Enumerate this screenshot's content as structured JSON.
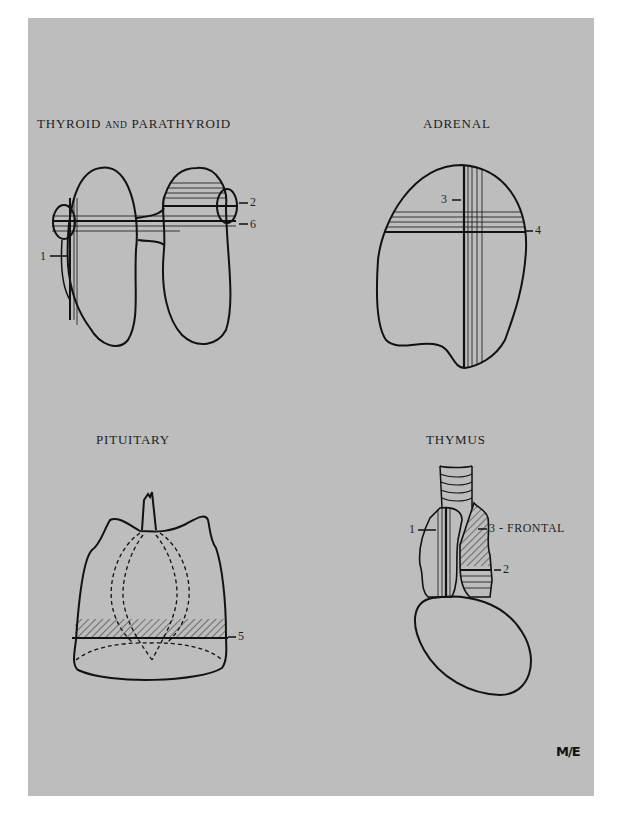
{
  "plate": {
    "background_color": "#bdbdbd",
    "page_color": "#ffffff",
    "ink_color": "#111111"
  },
  "panels": {
    "thyroid": {
      "title_main_1": "THYROID",
      "title_small": "AND",
      "title_main_2": "PARATHYROID",
      "markers": [
        {
          "id": "1",
          "label": "1"
        },
        {
          "id": "2",
          "label": "2"
        },
        {
          "id": "6",
          "label": "6"
        }
      ]
    },
    "adrenal": {
      "title": "ADRENAL",
      "markers": [
        {
          "id": "3",
          "label": "3"
        },
        {
          "id": "4",
          "label": "4"
        }
      ]
    },
    "pituitary": {
      "title": "PITUITARY",
      "markers": [
        {
          "id": "5",
          "label": "5"
        }
      ]
    },
    "thymus": {
      "title": "THYMUS",
      "markers": [
        {
          "id": "1",
          "label": "1"
        },
        {
          "id": "3",
          "label": "3 - FRONTAL"
        },
        {
          "id": "2",
          "label": "2"
        }
      ]
    }
  },
  "signature": {
    "text": "M/E"
  }
}
